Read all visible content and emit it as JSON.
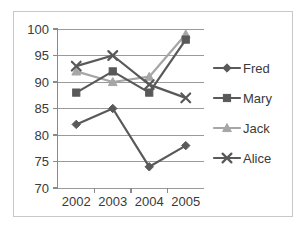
{
  "chart_data": {
    "type": "line",
    "title": "",
    "xlabel": "",
    "ylabel": "",
    "categories": [
      "2002",
      "2003",
      "2004",
      "2005"
    ],
    "ylim": [
      70,
      100
    ],
    "yticks": [
      70,
      75,
      80,
      85,
      90,
      95,
      100
    ],
    "ytick_labels": [
      "70",
      "75",
      "80",
      "85",
      "90",
      "95",
      "100"
    ],
    "grid": "horizontal",
    "legend_position": "right",
    "series": [
      {
        "name": "Fred",
        "marker": "diamond",
        "color": "#595959",
        "values": [
          82,
          85,
          74,
          78
        ]
      },
      {
        "name": "Mary",
        "marker": "square",
        "color": "#595959",
        "values": [
          88,
          92,
          88,
          98
        ]
      },
      {
        "name": "Jack",
        "marker": "triangle",
        "color": "#a6a6a6",
        "values": [
          92,
          90,
          91,
          99
        ]
      },
      {
        "name": "Alice",
        "marker": "x",
        "color": "#595959",
        "values": [
          93,
          95,
          89.5,
          87
        ]
      }
    ]
  },
  "legend": {
    "items": [
      {
        "label": "Fred",
        "marker": "diamond-marker",
        "color": "#595959"
      },
      {
        "label": "Mary",
        "marker": "square-marker",
        "color": "#595959"
      },
      {
        "label": "Jack",
        "marker": "triangle-marker",
        "color": "#a6a6a6"
      },
      {
        "label": "Alice",
        "marker": "x-marker",
        "color": "#595959"
      }
    ]
  },
  "axis": {
    "y_labels": [
      "100",
      "95",
      "90",
      "85",
      "80",
      "75",
      "70"
    ],
    "x_labels": [
      "2002",
      "2003",
      "2004",
      "2005"
    ]
  },
  "colors": {
    "border": "#c8c8c8",
    "grid": "#9a9a9a",
    "axis": "#8a8a8a",
    "text": "#3a3a3a",
    "background": "#ffffff"
  }
}
